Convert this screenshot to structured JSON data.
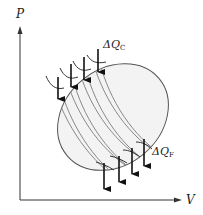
{
  "diagram": {
    "type": "pv-cycle-decomposition",
    "axes": {
      "y_label": "P",
      "x_label": "V"
    },
    "annotations": {
      "heat_in": {
        "symbol": "ΔQ",
        "subscript": "C"
      },
      "heat_out": {
        "symbol": "ΔQ",
        "subscript": "F"
      }
    },
    "colors": {
      "stroke": "#333333",
      "fill": "#f2f2f2",
      "strip_line": "#777777"
    },
    "strip_count": 4
  }
}
